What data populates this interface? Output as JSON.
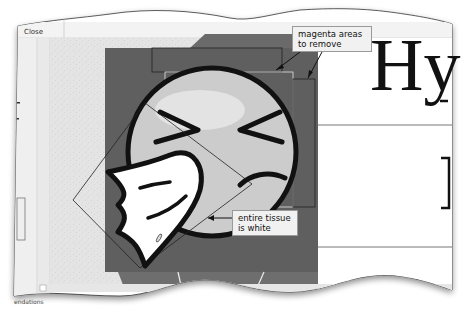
{
  "window": {
    "close_label": "Close",
    "status_text": "endations"
  },
  "canvas": {
    "background_color": "#8a8a8a",
    "dark_region_color": "#5f5f5f",
    "face_color": "#cfcfcf",
    "outline_color": "#111111"
  },
  "callouts": {
    "top": {
      "line1": "magenta areas",
      "line2": "to remove"
    },
    "bottom": {
      "line1": "entire tissue",
      "line2": "is white"
    }
  },
  "document_preview": {
    "heading_letter": "Hy"
  },
  "scrollbar": {
    "left_arrow": "◂"
  }
}
